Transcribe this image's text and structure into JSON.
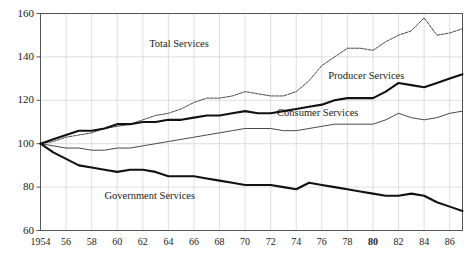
{
  "figure": {
    "faint_top_caption": "",
    "background_color": "#ffffff",
    "axis_color": "#555555",
    "grid_color": "#c8c8c8"
  },
  "chart_data": {
    "type": "line",
    "title": "",
    "subtitle": "",
    "xlabel": "",
    "ylabel": "",
    "xlim": [
      1954,
      1987
    ],
    "ylim": [
      60,
      160
    ],
    "grid": true,
    "legend_position": "inline-annotations",
    "y_ticks": [
      60,
      80,
      100,
      120,
      140,
      160
    ],
    "x_ticks": [
      1954,
      1956,
      1958,
      1960,
      1962,
      1964,
      1966,
      1968,
      1970,
      1972,
      1974,
      1976,
      1978,
      1980,
      1982,
      1984,
      1986
    ],
    "x_tick_labels": [
      "1954",
      "56",
      "58",
      "60",
      "62",
      "64",
      "66",
      "68",
      "70",
      "72",
      "74",
      "76",
      "78",
      "80",
      "82",
      "84",
      "86"
    ],
    "x_tick_bold": [
      "80"
    ],
    "x": [
      1954,
      1955,
      1956,
      1957,
      1958,
      1959,
      1960,
      1961,
      1962,
      1963,
      1964,
      1965,
      1966,
      1967,
      1968,
      1969,
      1970,
      1971,
      1972,
      1973,
      1974,
      1975,
      1976,
      1977,
      1978,
      1979,
      1980,
      1981,
      1982,
      1983,
      1984,
      1985,
      1986,
      1987
    ],
    "series": [
      {
        "name": "Total Services",
        "style": "thin-dashed",
        "color": "#333333",
        "label_position": {
          "x": 1962.5,
          "y": 146
        },
        "values": [
          100,
          101,
          103,
          104,
          105,
          107,
          108,
          109,
          111,
          113,
          114,
          116,
          119,
          121,
          121,
          122,
          124,
          123,
          122,
          122,
          124,
          129,
          136,
          140,
          144,
          144,
          143,
          147,
          150,
          152,
          158,
          150,
          151,
          153
        ]
      },
      {
        "name": "Producer Services",
        "style": "thick-solid",
        "color": "#111111",
        "label_position": {
          "x": 1976.5,
          "y": 131
        },
        "values": [
          100,
          102,
          104,
          106,
          106,
          107,
          109,
          109,
          110,
          110,
          111,
          111,
          112,
          113,
          113,
          114,
          115,
          114,
          114,
          115,
          116,
          117,
          118,
          120,
          121,
          121,
          121,
          124,
          128,
          127,
          126,
          128,
          130,
          132
        ]
      },
      {
        "name": "Consumer Services",
        "style": "thin-solid",
        "color": "#333333",
        "label_position": {
          "x": 1972.5,
          "y": 114
        },
        "values": [
          100,
          99,
          98,
          98,
          97,
          97,
          98,
          98,
          99,
          100,
          101,
          102,
          103,
          104,
          105,
          106,
          107,
          107,
          107,
          106,
          106,
          107,
          108,
          109,
          109,
          109,
          109,
          111,
          114,
          112,
          111,
          112,
          114,
          115
        ]
      },
      {
        "name": "Government Services",
        "style": "thick-solid",
        "color": "#111111",
        "label_position": {
          "x": 1959.0,
          "y": 76
        },
        "values": [
          100,
          96,
          93,
          90,
          89,
          88,
          87,
          88,
          88,
          87,
          85,
          85,
          85,
          84,
          83,
          82,
          81,
          81,
          81,
          80,
          79,
          82,
          81,
          80,
          79,
          78,
          77,
          76,
          76,
          77,
          76,
          73,
          71,
          69
        ]
      }
    ]
  }
}
